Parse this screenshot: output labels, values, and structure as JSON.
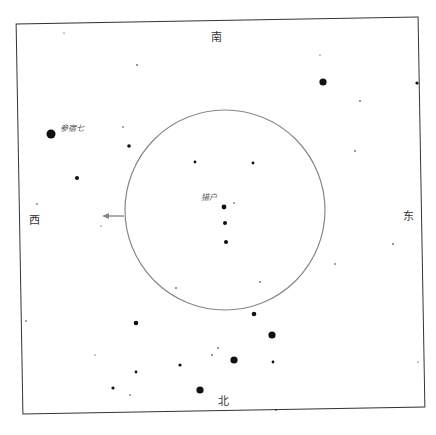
{
  "chart": {
    "title": "",
    "directions": {
      "south": "南",
      "north": "北",
      "west": "西",
      "east": "东"
    },
    "labels": [
      {
        "text": "参宿七",
        "x": 60,
        "y": 131
      },
      {
        "text": "猎户",
        "x": 201,
        "y": 200
      }
    ],
    "circle": {
      "cx": 225,
      "cy": 210,
      "r": 100,
      "color": "#888888"
    },
    "arrow": {
      "from_x": 124,
      "from_y": 216,
      "to_x": 102,
      "to_y": 216,
      "color": "#888888"
    },
    "stars": [
      {
        "x": 51,
        "y": 134,
        "r": 4.5
      },
      {
        "x": 323,
        "y": 82,
        "r": 3.6
      },
      {
        "x": 77,
        "y": 178,
        "r": 2
      },
      {
        "x": 129,
        "y": 146,
        "r": 1.8
      },
      {
        "x": 195,
        "y": 162,
        "r": 1.4
      },
      {
        "x": 253,
        "y": 163,
        "r": 1.4
      },
      {
        "x": 224,
        "y": 207,
        "r": 2.4
      },
      {
        "x": 225,
        "y": 223,
        "r": 2
      },
      {
        "x": 226,
        "y": 242,
        "r": 2
      },
      {
        "x": 254,
        "y": 314,
        "r": 2.3
      },
      {
        "x": 272,
        "y": 335,
        "r": 3.6
      },
      {
        "x": 234,
        "y": 360,
        "r": 3.6
      },
      {
        "x": 200,
        "y": 390,
        "r": 3.6
      },
      {
        "x": 136,
        "y": 323,
        "r": 2.3
      },
      {
        "x": 180,
        "y": 365,
        "r": 1.6
      },
      {
        "x": 273,
        "y": 362,
        "r": 1.4
      },
      {
        "x": 136,
        "y": 372,
        "r": 1.4
      },
      {
        "x": 113,
        "y": 388,
        "r": 1.6
      },
      {
        "x": 417,
        "y": 83,
        "r": 1.6
      },
      {
        "x": 137,
        "y": 65,
        "r": 0.8
      },
      {
        "x": 64,
        "y": 33,
        "r": 0.6
      },
      {
        "x": 37,
        "y": 204,
        "r": 0.7
      },
      {
        "x": 123,
        "y": 127,
        "r": 0.7
      },
      {
        "x": 360,
        "y": 101,
        "r": 0.8
      },
      {
        "x": 355,
        "y": 151,
        "r": 0.8
      },
      {
        "x": 320,
        "y": 55,
        "r": 0.6
      },
      {
        "x": 393,
        "y": 244,
        "r": 0.8
      },
      {
        "x": 335,
        "y": 264,
        "r": 0.7
      },
      {
        "x": 260,
        "y": 282,
        "r": 0.8
      },
      {
        "x": 176,
        "y": 288,
        "r": 0.8
      },
      {
        "x": 234,
        "y": 203,
        "r": 0.7
      },
      {
        "x": 26,
        "y": 321,
        "r": 0.7
      },
      {
        "x": 95,
        "y": 355,
        "r": 0.6
      },
      {
        "x": 218,
        "y": 348,
        "r": 0.8
      },
      {
        "x": 212,
        "y": 355,
        "r": 0.8
      },
      {
        "x": 130,
        "y": 395,
        "r": 0.7
      },
      {
        "x": 276,
        "y": 410,
        "r": 0.8
      },
      {
        "x": 418,
        "y": 362,
        "r": 0.6
      },
      {
        "x": 101,
        "y": 226,
        "r": 0.6
      }
    ]
  }
}
